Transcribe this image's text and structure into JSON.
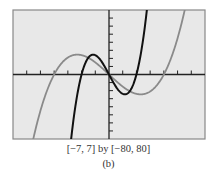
{
  "chart_data": {
    "type": "line",
    "title": "",
    "window_caption": "[−7, 7] by [−80, 80]",
    "subcaption": "(b)",
    "xlabel": "",
    "ylabel": "",
    "xlim": [
      -7,
      7
    ],
    "ylim": [
      -80,
      80
    ],
    "xscl": 1,
    "yscl": 10,
    "grid": false,
    "legend": "none",
    "colors": {
      "background": "#e8e8e8",
      "frame": "#888888",
      "axis": "#222222",
      "curve_gray": "#8a8a8a",
      "curve_black": "#111111"
    },
    "series": [
      {
        "name": "y = x^3 - 16x",
        "color_key": "curve_gray",
        "coefficients": {
          "a3": 1,
          "a1": -16
        }
      },
      {
        "name": "y = 8x^3 - 32x",
        "color_key": "curve_black",
        "coefficients": {
          "a3": 8,
          "a1": -32
        }
      }
    ]
  }
}
